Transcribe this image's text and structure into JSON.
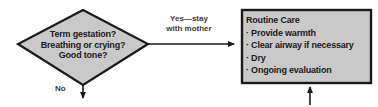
{
  "diagram": {
    "background_color": "#ffffff",
    "shape_fill": "#c9c9c9",
    "shape_stroke": "#1a1a1a",
    "text_color": "#1a1a1a",
    "label_color": "#3a3a3a"
  },
  "decision": {
    "shape": "diamond",
    "lines": [
      "Term gestation?",
      "Breathing or crying?",
      "Good tone?"
    ]
  },
  "care_box": {
    "shape": "rectangle",
    "title": "Routine Care",
    "bullets": [
      "Provide warmth",
      "Clear airway if necessary",
      "Dry",
      "Ongoing evaluation"
    ],
    "bullet_glyph": "·"
  },
  "edges": [
    {
      "id": "yes-edge",
      "label_lines": [
        "Yes—stay",
        "with mother"
      ],
      "from": "decision",
      "to": "care_box",
      "direction": "right",
      "arrowhead": true
    },
    {
      "id": "no-edge",
      "label_lines": [
        "No"
      ],
      "from": "decision",
      "to": "below",
      "direction": "down",
      "arrowhead": true
    },
    {
      "id": "inbound-edge",
      "label_lines": [],
      "from": "below",
      "to": "care_box",
      "direction": "up",
      "arrowhead": true
    }
  ]
}
